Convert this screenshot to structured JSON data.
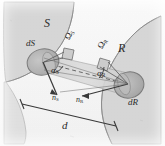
{
  "figure": {
    "caption_title": "Radiative exchange geometry between a sending surface element and a receiving surface element",
    "background_color": "#ffffff",
    "ink_color": "#2b2b2b",
    "surface_fill": "#d9d9d9",
    "surface_stroke": "#9a9a9a",
    "patch_fill": "#bdbdbd",
    "patch_stroke": "#7d7d7d",
    "beam_fill": "#cccccc"
  },
  "labels": {
    "surface_s": "S",
    "surface_r": "R",
    "element_ds": "dS",
    "element_dr": "dR",
    "solid_angle_s": "Ω",
    "solid_angle_s_sub": "S",
    "solid_angle_r": "Ω",
    "solid_angle_r_sub": "R",
    "angle_s": "α",
    "angle_s_sub": "S",
    "angle_r": "α",
    "angle_r_sub": "R",
    "normal_s": "n",
    "normal_s_sub": "S",
    "normal_r": "n",
    "normal_r_sub": "R",
    "distance": "d"
  },
  "geometry": {
    "ds_center": [
      43,
      62
    ],
    "dr_center": [
      128,
      84
    ],
    "distance_bracket_left": [
      20,
      106
    ],
    "distance_bracket_right": [
      114,
      126
    ],
    "beam_axis_angle_deg": 14
  }
}
